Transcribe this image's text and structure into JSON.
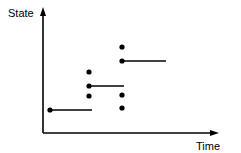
{
  "figure": {
    "title": "",
    "background_color": "#ffffff",
    "ink_color": "#000000",
    "width": 241,
    "height": 153
  },
  "axes": {
    "y_axis": {
      "label": "State",
      "has_arrowhead": true,
      "x": 43,
      "y_top": 8,
      "y_bottom": 133,
      "label_x": 8,
      "label_y": 17
    },
    "x_axis": {
      "label": "Time",
      "has_arrowhead": true,
      "y": 133,
      "x_left": 43,
      "x_right": 218,
      "label_x": 196,
      "label_y": 149
    }
  },
  "chart_data": {
    "type": "scatter",
    "title": "",
    "xlabel": "Time",
    "ylabel": "State",
    "grid": false,
    "legend": null,
    "axis_ticks": {
      "x": [],
      "y": []
    },
    "xlim": [
      43,
      218
    ],
    "ylim": [
      133,
      8
    ],
    "columns": [
      {
        "name": "t1",
        "x": 50
      },
      {
        "name": "t2",
        "x": 89
      },
      {
        "name": "t3",
        "x": 122
      }
    ],
    "points": [
      {
        "id": "p1",
        "column": "t1",
        "x": 50,
        "y": 110,
        "radius": 2.6
      },
      {
        "id": "p2",
        "column": "t2",
        "x": 89,
        "y": 72,
        "radius": 2.6
      },
      {
        "id": "p3",
        "column": "t2",
        "x": 89,
        "y": 86,
        "radius": 2.6
      },
      {
        "id": "p4",
        "column": "t2",
        "x": 89,
        "y": 96,
        "radius": 2.6
      },
      {
        "id": "p5",
        "column": "t3",
        "x": 122,
        "y": 47,
        "radius": 2.6
      },
      {
        "id": "p6",
        "column": "t3",
        "x": 122,
        "y": 61,
        "radius": 2.6
      },
      {
        "id": "p7",
        "column": "t3",
        "x": 122,
        "y": 95,
        "radius": 2.6
      },
      {
        "id": "p8",
        "column": "t3",
        "x": 122,
        "y": 108,
        "radius": 2.6
      }
    ],
    "segments": [
      {
        "id": "s1",
        "from_point": "p1",
        "x1": 50,
        "x2": 92,
        "y": 110,
        "width": 1.6
      },
      {
        "id": "s2",
        "from_point": "p3",
        "x1": 89,
        "x2": 124,
        "y": 86,
        "width": 1.6
      },
      {
        "id": "s3",
        "from_point": "p6",
        "x1": 122,
        "x2": 166,
        "y": 61,
        "width": 1.6
      }
    ]
  }
}
